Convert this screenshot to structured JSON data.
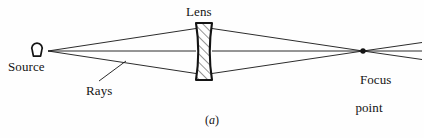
{
  "figure": {
    "caption_prefix": "(",
    "caption_letter": "a",
    "caption_suffix": ")",
    "caption_full": "(a)",
    "background_color": "#fefefe",
    "ink_color": "#141414",
    "width": 424,
    "height": 138
  },
  "labels": {
    "source": "Source",
    "lens": "Lens",
    "rays": "Rays",
    "focus_line1": "Focus",
    "focus_line2": "point"
  },
  "diagram": {
    "type": "optics-ray-diagram",
    "source_marker": "lightbulb-icon",
    "focus_marker": "dot",
    "lens_fill": "diagonal-hatch",
    "elements": {
      "source_point": {
        "x": 48,
        "y": 51
      },
      "bulb": {
        "cx": 37,
        "cy": 48,
        "r": 5.2
      },
      "lens": {
        "x_left": 196,
        "x_right": 212,
        "y_top": 23,
        "y_bottom": 80,
        "bulge": 4
      },
      "focus_point": {
        "x": 363,
        "y": 51,
        "r": 2.6
      },
      "optical_axis": {
        "y": 51,
        "x_start": 48,
        "x_end": 424
      }
    },
    "rays": [
      {
        "name": "upper-incident",
        "from": [
          48,
          51
        ],
        "to": [
          196,
          29
        ]
      },
      {
        "name": "axis-incident",
        "from": [
          48,
          51
        ],
        "to": [
          196,
          51
        ]
      },
      {
        "name": "lower-incident",
        "from": [
          48,
          51
        ],
        "to": [
          196,
          73
        ]
      },
      {
        "name": "upper-refracted",
        "from": [
          212,
          29
        ],
        "to": [
          363,
          51
        ]
      },
      {
        "name": "axis-refracted",
        "from": [
          212,
          51
        ],
        "to": [
          363,
          51
        ]
      },
      {
        "name": "lower-refracted",
        "from": [
          212,
          73
        ],
        "to": [
          363,
          51
        ]
      },
      {
        "name": "upper-diverging",
        "from": [
          363,
          51
        ],
        "to": [
          424,
          43
        ]
      },
      {
        "name": "axis-diverging",
        "from": [
          363,
          51
        ],
        "to": [
          424,
          51
        ]
      },
      {
        "name": "lower-diverging",
        "from": [
          363,
          51
        ],
        "to": [
          424,
          59
        ]
      }
    ],
    "leader_lines": [
      {
        "name": "rays-leader",
        "from": [
          98,
          82
        ],
        "to": [
          125,
          62
        ]
      }
    ]
  }
}
